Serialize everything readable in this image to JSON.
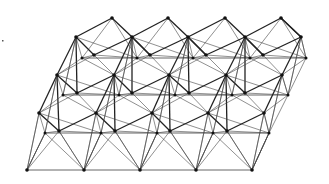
{
  "diagram": {
    "type": "lattice-graph",
    "colors": {
      "background": "#ffffff",
      "edge": "#222222",
      "node": "#111111"
    },
    "stray_mark": {
      "x": 2,
      "y": 40
    },
    "rows": {
      "A": {
        "y": 18,
        "xs": [
          112,
          168,
          225,
          281
        ],
        "r": 1.8
      },
      "B": {
        "y": 37,
        "xs": [
          76,
          132,
          188,
          245,
          301
        ],
        "r": 1.8
      },
      "S1": {
        "y": 58,
        "xs": [
          82,
          137,
          193,
          250,
          306
        ],
        "r": 1.5
      },
      "G1": {
        "y": 55,
        "xs": [
          94,
          150,
          206,
          263
        ],
        "r": 1.8
      },
      "C": {
        "y": 75,
        "xs": [
          57,
          114,
          169,
          226,
          282
        ],
        "r": 1.8
      },
      "S2": {
        "y": 95,
        "xs": [
          63,
          119,
          175,
          232,
          288
        ],
        "r": 1.5
      },
      "G2": {
        "y": 93,
        "xs": [
          77,
          132,
          189,
          245
        ],
        "r": 1.8
      },
      "D": {
        "y": 113,
        "xs": [
          39,
          96,
          152,
          208,
          264
        ],
        "r": 1.8
      },
      "S3": {
        "y": 133,
        "xs": [
          45,
          101,
          157,
          213,
          269
        ],
        "r": 1.5
      },
      "G3": {
        "y": 131,
        "xs": [
          59,
          115,
          170,
          227
        ],
        "r": 1.8
      },
      "E": {
        "y": 170,
        "xs": [
          27,
          84,
          140,
          196,
          252
        ],
        "r": 1.8
      }
    },
    "layers": [
      {
        "top": "A",
        "mid": "B",
        "small": "S1",
        "big": "G1"
      },
      {
        "top": "B",
        "mid": "C",
        "small": "S2",
        "big": "G2",
        "skipTop": true
      },
      {
        "top": "C",
        "mid": "D",
        "small": "S3",
        "big": "G3",
        "skipTop": true
      }
    ],
    "horizontal_rows": [
      "S1",
      "S2",
      "S3",
      "E"
    ],
    "bottom": {
      "row": "E",
      "from": [
        "D",
        "S3",
        "G3"
      ]
    }
  }
}
